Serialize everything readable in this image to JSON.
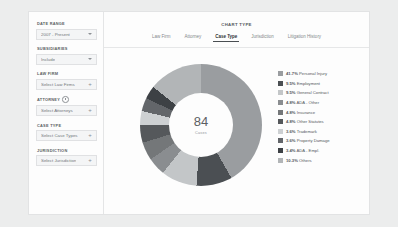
{
  "sidebar": {
    "filters": [
      {
        "label": "DATE RANGE",
        "value": "2007 - Present",
        "control": "dropdown"
      },
      {
        "label": "SUBSIDIARIES",
        "value": "Include",
        "control": "dropdown"
      },
      {
        "label": "LAW FIRM",
        "value": "Select Law Firms",
        "control": "add"
      },
      {
        "label": "ATTORNEY",
        "value": "Select Attorneys",
        "control": "add",
        "info": true
      },
      {
        "label": "CASE TYPE",
        "value": "Select Case Types",
        "control": "add"
      },
      {
        "label": "JURISDICTION",
        "value": "Select Jurisdiction",
        "control": "add"
      }
    ]
  },
  "main": {
    "chart_type_title": "CHART TYPE",
    "tabs": [
      {
        "label": "Law Firm",
        "active": false
      },
      {
        "label": "Attorney",
        "active": false
      },
      {
        "label": "Case Type",
        "active": true
      },
      {
        "label": "Jurisdiction",
        "active": false
      },
      {
        "label": "Litigation History",
        "active": false
      }
    ]
  },
  "chart_data": {
    "type": "pie",
    "title": "Case Type",
    "center_value": "84",
    "center_caption": "Cases",
    "legend_position": "right",
    "labels": [
      "Personal Injury",
      "Employment",
      "General Contract",
      "ADA - Other",
      "Insurance",
      "Other Statutes",
      "Trademark",
      "Property Damage",
      "ADA - Empl.",
      "Others"
    ],
    "values": [
      41.7,
      9.5,
      9.5,
      4.8,
      4.8,
      4.8,
      3.6,
      3.6,
      3.4,
      10.3
    ],
    "colors": [
      "#9a9da0",
      "#4b4f53",
      "#c3c6c8",
      "#8a8d90",
      "#747779",
      "#55585b",
      "#cdd0d2",
      "#63666a",
      "#3d4145",
      "#b2b5b7"
    ],
    "legend_entries": [
      {
        "pct": "41.7%",
        "label": "Personal Injury",
        "color": "#9a9da0"
      },
      {
        "pct": "9.5%",
        "label": "Employment",
        "color": "#4b4f53"
      },
      {
        "pct": "9.5%",
        "label": "General Contract",
        "color": "#c3c6c8"
      },
      {
        "pct": "4.8%",
        "label": "ADA - Other",
        "color": "#8a8d90"
      },
      {
        "pct": "4.8%",
        "label": "Insurance",
        "color": "#747779"
      },
      {
        "pct": "4.8%",
        "label": "Other Statutes",
        "color": "#55585b"
      },
      {
        "pct": "3.6%",
        "label": "Trademark",
        "color": "#cdd0d2"
      },
      {
        "pct": "3.6%",
        "label": "Property Damage",
        "color": "#63666a"
      },
      {
        "pct": "3.4%",
        "label": "ADA - Empl.",
        "color": "#3d4145"
      },
      {
        "pct": "10.3%",
        "label": "Others",
        "color": "#b2b5b7"
      }
    ]
  }
}
